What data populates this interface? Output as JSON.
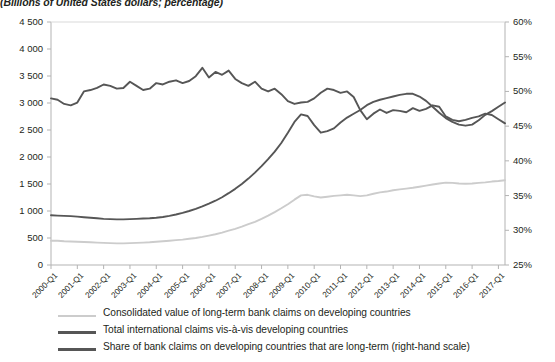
{
  "subtitle": "(Billions of United States dollars; percentage)",
  "axes": {
    "left_ticks": [
      "0",
      "500",
      "1 000",
      "1 500",
      "2 000",
      "2 500",
      "3 000",
      "3 500",
      "4 000",
      "4 500"
    ],
    "right_ticks": [
      "25%",
      "30%",
      "35%",
      "40%",
      "45%",
      "50%",
      "55%",
      "60%"
    ],
    "x_ticks": [
      "2000-Q1",
      "2001-Q1",
      "2002-Q1",
      "2003-Q1",
      "2004-Q1",
      "2005-Q1",
      "2006-Q1",
      "2007-Q1",
      "2008-Q1",
      "2009-Q1",
      "2010-Q1",
      "2011-Q1",
      "2012-Q1",
      "2013-Q1",
      "2014-Q1",
      "2015-Q1",
      "2016-Q1",
      "2017-Q1"
    ]
  },
  "legend": [
    {
      "label": "Consolidated value of long-term bank claims on developing countries",
      "color": "#cccccc"
    },
    {
      "label": "Total international claims vis-à-vis developing countries",
      "color": "#565656"
    },
    {
      "label": "Share of bank claims on developing countries that are long-term (right-hand scale)",
      "color": "#565656"
    }
  ],
  "colors": {
    "light_gray": "#cccccc",
    "dark_gray": "#565656",
    "axis": "#b3b3b3",
    "text": "#231f20"
  },
  "chart_data": {
    "type": "line",
    "title": "",
    "subtitle": "(Billions of United States dollars; percentage)",
    "xlabel": "",
    "ylabel": "",
    "grid": false,
    "legend_position": "bottom",
    "x": [
      "2000-Q1",
      "2000-Q2",
      "2000-Q3",
      "2000-Q4",
      "2001-Q1",
      "2001-Q2",
      "2001-Q3",
      "2001-Q4",
      "2002-Q1",
      "2002-Q2",
      "2002-Q3",
      "2002-Q4",
      "2003-Q1",
      "2003-Q2",
      "2003-Q3",
      "2003-Q4",
      "2004-Q1",
      "2004-Q2",
      "2004-Q3",
      "2004-Q4",
      "2005-Q1",
      "2005-Q2",
      "2005-Q3",
      "2005-Q4",
      "2006-Q1",
      "2006-Q2",
      "2006-Q3",
      "2006-Q4",
      "2007-Q1",
      "2007-Q2",
      "2007-Q3",
      "2007-Q4",
      "2008-Q1",
      "2008-Q2",
      "2008-Q3",
      "2008-Q4",
      "2009-Q1",
      "2009-Q2",
      "2009-Q3",
      "2009-Q4",
      "2010-Q1",
      "2010-Q2",
      "2010-Q3",
      "2010-Q4",
      "2011-Q1",
      "2011-Q2",
      "2011-Q3",
      "2011-Q4",
      "2012-Q1",
      "2012-Q2",
      "2012-Q3",
      "2012-Q4",
      "2013-Q1",
      "2013-Q2",
      "2013-Q3",
      "2013-Q4",
      "2014-Q1",
      "2014-Q2",
      "2014-Q3",
      "2014-Q4",
      "2015-Q1",
      "2015-Q2",
      "2015-Q3",
      "2015-Q4",
      "2016-Q1",
      "2016-Q2",
      "2016-Q3",
      "2016-Q4",
      "2017-Q1",
      "2017-Q2"
    ],
    "axis_left": {
      "label": "Billions of United States dollars",
      "min": 0,
      "max": 4500,
      "tick_step": 500
    },
    "axis_right": {
      "label": "Percentage",
      "min": 25,
      "max": 60,
      "tick_step": 5
    },
    "series": [
      {
        "name": "Consolidated value of long-term bank claims on developing countries",
        "axis": "left",
        "color": "#cccccc",
        "values": [
          450,
          450,
          440,
          435,
          430,
          425,
          420,
          415,
          410,
          405,
          400,
          400,
          405,
          410,
          415,
          420,
          430,
          440,
          450,
          460,
          470,
          485,
          500,
          520,
          545,
          570,
          600,
          635,
          670,
          710,
          755,
          800,
          855,
          915,
          980,
          1050,
          1125,
          1210,
          1290,
          1300,
          1270,
          1250,
          1265,
          1280,
          1290,
          1300,
          1290,
          1275,
          1290,
          1320,
          1345,
          1360,
          1385,
          1400,
          1415,
          1430,
          1450,
          1470,
          1490,
          1510,
          1525,
          1520,
          1510,
          1505,
          1510,
          1520,
          1530,
          1545,
          1555,
          1570
        ]
      },
      {
        "name": "Total international claims vis-à-vis developing countries",
        "axis": "left",
        "color": "#565656",
        "values": [
          920,
          915,
          910,
          905,
          895,
          885,
          875,
          865,
          855,
          850,
          845,
          845,
          850,
          855,
          860,
          865,
          875,
          890,
          910,
          935,
          965,
          1000,
          1040,
          1085,
          1135,
          1190,
          1255,
          1330,
          1410,
          1500,
          1600,
          1710,
          1830,
          1960,
          2100,
          2260,
          2450,
          2650,
          2790,
          2760,
          2590,
          2450,
          2480,
          2530,
          2640,
          2730,
          2800,
          2870,
          2960,
          3020,
          3060,
          3090,
          3120,
          3150,
          3170,
          3170,
          3120,
          3040,
          2930,
          2820,
          2720,
          2650,
          2600,
          2580,
          2600,
          2680,
          2780,
          2850,
          2930,
          3010
        ]
      },
      {
        "name": "Share of bank claims on developing countries that are long-term (right-hand scale)",
        "axis": "right",
        "color": "#565656",
        "values": [
          49.0,
          48.8,
          48.2,
          48.0,
          48.4,
          50.0,
          50.2,
          50.5,
          51.0,
          50.8,
          50.4,
          50.5,
          51.4,
          50.8,
          50.2,
          50.4,
          51.2,
          51.0,
          51.4,
          51.6,
          51.2,
          51.5,
          52.2,
          53.4,
          52.0,
          52.8,
          52.4,
          53.0,
          51.8,
          51.2,
          50.8,
          51.4,
          50.4,
          50.0,
          50.4,
          49.6,
          48.6,
          48.2,
          48.4,
          48.5,
          49.0,
          49.8,
          50.4,
          50.2,
          49.8,
          50.0,
          49.2,
          47.3,
          46.0,
          46.8,
          47.4,
          46.9,
          47.3,
          47.2,
          47.0,
          47.6,
          47.2,
          47.5,
          48.0,
          47.8,
          46.4,
          45.9,
          45.7,
          45.9,
          46.2,
          46.4,
          46.8,
          46.6,
          46.0,
          45.4
        ]
      }
    ]
  }
}
